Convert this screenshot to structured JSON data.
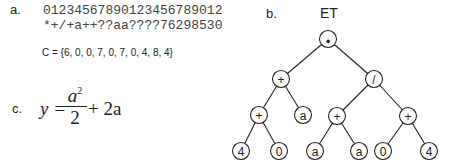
{
  "panel_a": {
    "label": "a.",
    "index_row": "01234567890123456789012",
    "expression_row": "*+/+a++??aa????76298530",
    "set_text": "C = {6, 0, 0, 7, 0, 7, 0, 4, 8, 4}"
  },
  "panel_b": {
    "label": "b.",
    "title": "ET",
    "nodes": [
      {
        "id": "n0",
        "symbol": "*",
        "x": 328,
        "y": 39
      },
      {
        "id": "n1",
        "symbol": "+",
        "x": 281,
        "y": 79
      },
      {
        "id": "n2",
        "symbol": "/",
        "x": 374,
        "y": 79
      },
      {
        "id": "n3",
        "symbol": "+",
        "x": 259,
        "y": 115
      },
      {
        "id": "n4",
        "symbol": "a",
        "x": 303,
        "y": 115
      },
      {
        "id": "n5",
        "symbol": "+",
        "x": 337,
        "y": 116
      },
      {
        "id": "n6",
        "symbol": "+",
        "x": 408,
        "y": 116
      },
      {
        "id": "n7",
        "symbol": "4",
        "x": 241,
        "y": 151
      },
      {
        "id": "n8",
        "symbol": "0",
        "x": 279,
        "y": 151
      },
      {
        "id": "n9",
        "symbol": "a",
        "x": 315,
        "y": 151
      },
      {
        "id": "n10",
        "symbol": "a",
        "x": 359,
        "y": 151
      },
      {
        "id": "n11",
        "symbol": "0",
        "x": 383,
        "y": 151
      },
      {
        "id": "n12",
        "symbol": "4",
        "x": 429,
        "y": 151
      }
    ],
    "edges": [
      [
        "n0",
        "n1"
      ],
      [
        "n0",
        "n2"
      ],
      [
        "n1",
        "n3"
      ],
      [
        "n1",
        "n4"
      ],
      [
        "n2",
        "n5"
      ],
      [
        "n2",
        "n6"
      ],
      [
        "n3",
        "n7"
      ],
      [
        "n3",
        "n8"
      ],
      [
        "n5",
        "n9"
      ],
      [
        "n5",
        "n10"
      ],
      [
        "n6",
        "n11"
      ],
      [
        "n6",
        "n12"
      ]
    ]
  },
  "panel_c": {
    "label": "c.",
    "lhs": "y =",
    "numerator_var": "a",
    "numerator_exp": "2",
    "denominator": "2",
    "rhs": "+ 2a"
  }
}
